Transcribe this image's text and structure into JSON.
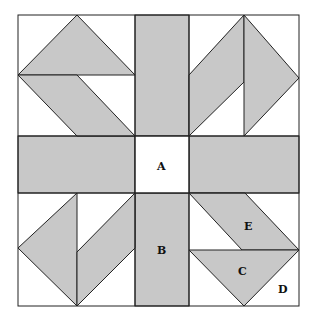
{
  "diagram": {
    "type": "quilt-block",
    "colors": {
      "fill": "#c8c8c8",
      "background": "#ffffff",
      "stroke": "#222222"
    },
    "labels": {
      "A": "A",
      "B": "B",
      "C": "C",
      "D": "D",
      "E": "E"
    }
  }
}
